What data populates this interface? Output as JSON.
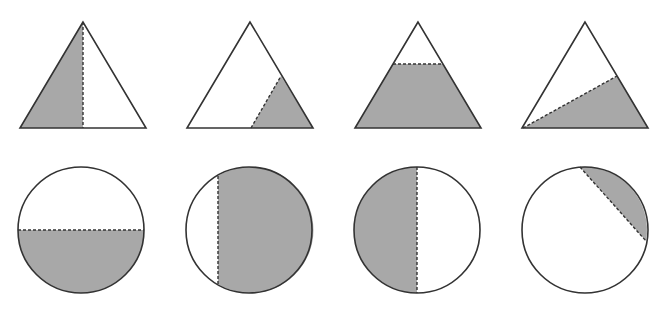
{
  "figure": {
    "colors": {
      "shade": "#a8a8a8",
      "stroke": "#333333",
      "background": "#ffffff"
    },
    "triangles": [
      {
        "id": "triangle-1",
        "shaded_part": "left half",
        "divider": "vertical dashed line from apex to base midpoint"
      },
      {
        "id": "triangle-2",
        "shaded_part": "lower-right corner region",
        "divider": "dashed line from base midpoint to right side"
      },
      {
        "id": "triangle-3",
        "shaded_part": "lower trapezoid",
        "divider": "horizontal dashed line"
      },
      {
        "id": "triangle-4",
        "shaded_part": "lower-right region",
        "divider": "dashed line from bottom-left vertex to right side"
      }
    ],
    "circles": [
      {
        "id": "circle-1",
        "shaded_part": "bottom half",
        "divider": "horizontal dashed diameter"
      },
      {
        "id": "circle-2",
        "shaded_part": "large right segment",
        "divider": "vertical dashed chord left of center"
      },
      {
        "id": "circle-3",
        "shaded_part": "left half",
        "divider": "vertical dashed diameter"
      },
      {
        "id": "circle-4",
        "shaded_part": "small upper-right segment",
        "divider": "diagonal dashed chord"
      }
    ]
  }
}
